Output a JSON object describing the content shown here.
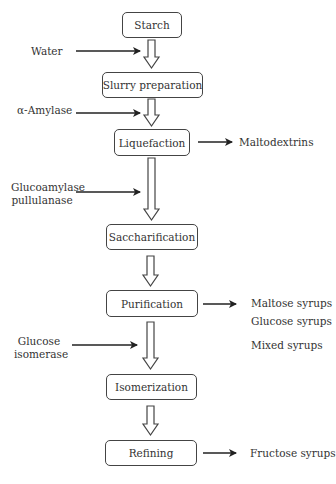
{
  "diagram": {
    "type": "flowchart",
    "title": "",
    "steps": [
      {
        "id": "starch",
        "label": "Starch"
      },
      {
        "id": "slurry",
        "label": "Slurry preparation"
      },
      {
        "id": "liquefaction",
        "label": "Liquefaction"
      },
      {
        "id": "saccharification",
        "label": "Saccharification"
      },
      {
        "id": "purification",
        "label": "Purification"
      },
      {
        "id": "isomerization",
        "label": "Isomerization"
      },
      {
        "id": "refining",
        "label": "Refining"
      }
    ],
    "inputs": [
      {
        "label": "Water",
        "to": "between starch and slurry preparation"
      },
      {
        "label": "α-Amylase",
        "to": "between slurry preparation and liquefaction"
      },
      {
        "label_line1": "Glucoamylase",
        "label_line2": "pullulanase",
        "to": "between liquefaction and saccharification"
      },
      {
        "label_line1": "Glucose",
        "label_line2": "isomerase",
        "to": "between purification and isomerization"
      }
    ],
    "outputs": [
      {
        "from": "liquefaction",
        "products": [
          "Maltodextrins"
        ]
      },
      {
        "from": "purification",
        "products": [
          "Maltose syrups",
          "Glucose syrups",
          "Mixed syrups"
        ]
      },
      {
        "from": "refining",
        "products": [
          "Fructose syrups"
        ]
      }
    ]
  }
}
